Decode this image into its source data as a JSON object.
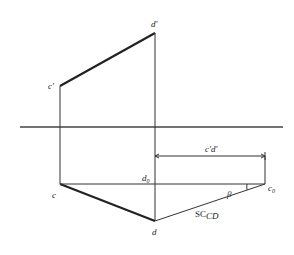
{
  "diagram": {
    "type": "orthographic-projection-true-length",
    "labels": {
      "d_prime": "d′",
      "c_prime": "c′",
      "c": "c",
      "d": "d",
      "d0_base": "d",
      "d0_sub": "0",
      "c0_base": "c",
      "c0_sub": "0",
      "c_prime_d_prime": "c′d′",
      "beta": "β",
      "true_length_base": "SC",
      "true_length_sub": "CD"
    },
    "points": {
      "d_prime": [
        155,
        33
      ],
      "c_prime": [
        60,
        86
      ],
      "c": [
        60,
        184
      ],
      "d": [
        155,
        221
      ],
      "d0": [
        155,
        184
      ],
      "c0": [
        265,
        184
      ]
    },
    "axis": {
      "y": 127,
      "x_start": 20,
      "x_end": 283
    },
    "dimension_line_y": 156,
    "colors": {
      "line": "#333333",
      "background": "#ffffff"
    }
  }
}
